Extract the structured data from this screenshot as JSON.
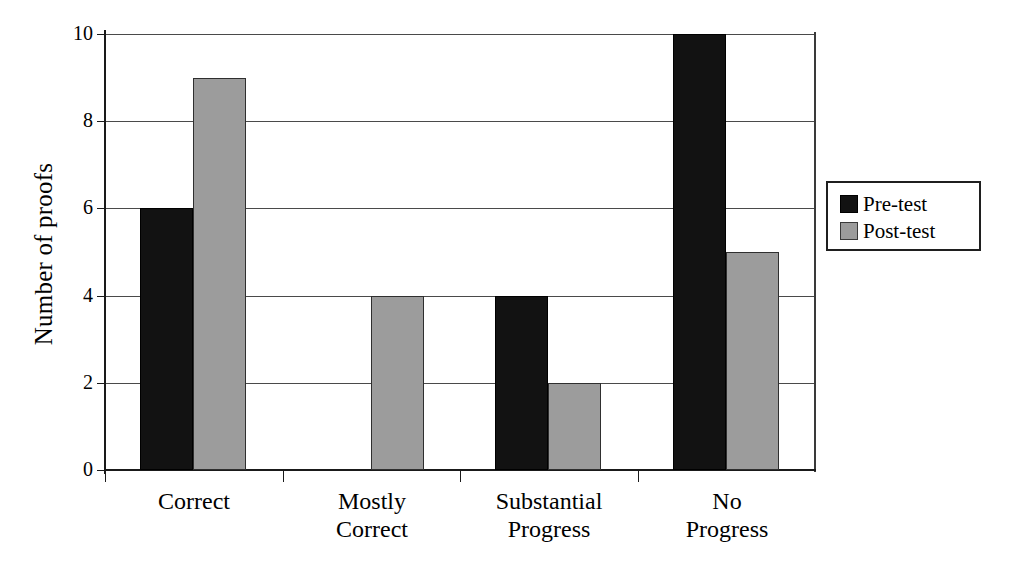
{
  "chart_data": {
    "type": "bar",
    "title": "",
    "subtitle": "",
    "xlabel": "",
    "ylabel": "Number of proofs",
    "categories": [
      "Correct",
      "Mostly Correct",
      "Substantial Progress",
      "No Progress"
    ],
    "category_lines": [
      [
        "Correct"
      ],
      [
        "Mostly",
        "Correct"
      ],
      [
        "Substantial",
        "Progress"
      ],
      [
        "No",
        "Progress"
      ]
    ],
    "series": [
      {
        "name": "Pre-test",
        "color": "#121212",
        "values": [
          6,
          0,
          4,
          10
        ]
      },
      {
        "name": "Post-test",
        "color": "#9c9c9c",
        "values": [
          9,
          4,
          2,
          5
        ]
      }
    ],
    "ylim": [
      0,
      10
    ],
    "ytick_values": [
      0,
      2,
      4,
      6,
      8,
      10
    ],
    "ytick_labels": [
      "0",
      "2",
      "4",
      "6",
      "8",
      "10"
    ],
    "grid": true,
    "grid_axis": "y",
    "legend_position": "right",
    "legend_entries": [
      "Pre-test",
      "Post-test"
    ]
  },
  "axes": {
    "y_title": "Number of proofs"
  },
  "legend": {
    "items": [
      {
        "label": "Pre-test"
      },
      {
        "label": "Post-test"
      }
    ]
  }
}
